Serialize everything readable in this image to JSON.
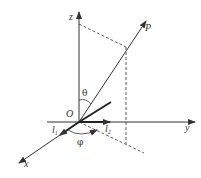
{
  "diagram": {
    "type": "spherical-coordinates-3d-axes",
    "colors": {
      "line": "#333333",
      "background": "#ffffff"
    },
    "origin": {
      "label": "O",
      "x": 79,
      "y": 122
    },
    "axes": {
      "z": {
        "label": "z",
        "from": [
          79,
          122
        ],
        "to": [
          79,
          12
        ]
      },
      "y": {
        "label": "y",
        "from": [
          47,
          122
        ],
        "to": [
          195,
          122
        ]
      },
      "x": {
        "label": "x",
        "from": [
          79,
          122
        ],
        "to": [
          19,
          163
        ]
      }
    },
    "point": {
      "label": "P",
      "from": [
        79,
        122
      ],
      "to": [
        146,
        21
      ]
    },
    "angles": {
      "theta": "θ",
      "phi": "φ"
    },
    "vectors": {
      "l1": {
        "label": "l",
        "subscript": "1"
      },
      "l2": {
        "label": "l",
        "subscript": "2"
      }
    }
  }
}
